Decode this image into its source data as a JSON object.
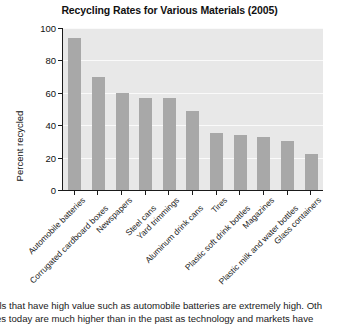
{
  "chart_data": {
    "type": "bar",
    "title": "Recycling Rates for Various Materials (2005)",
    "xlabel": "",
    "ylabel": "Percent recycled",
    "ylim": [
      0,
      100
    ],
    "yticks": [
      0,
      20,
      40,
      60,
      80,
      100
    ],
    "grid": true,
    "legend": "none",
    "bar_color": "#a8a8a8",
    "plot_background": "#e8e8e8",
    "categories": [
      "Automobile batteries",
      "Corrugated cardboard boxes",
      "Newspapers",
      "Steel cans",
      "Yard trimmings",
      "Aluminum drink cans",
      "Tires",
      "Plastic soft drink bottles",
      "Magazines",
      "Plastic milk and water bottles",
      "Glass containers"
    ],
    "values": [
      94,
      70,
      60,
      57,
      57,
      49,
      35,
      34,
      33,
      30,
      22
    ]
  },
  "body_text": {
    "line1": "ials that have high value such as automobile batteries are extremely high. Oth",
    "line2": "ates today are much higher than in the past as technology and markets have"
  }
}
